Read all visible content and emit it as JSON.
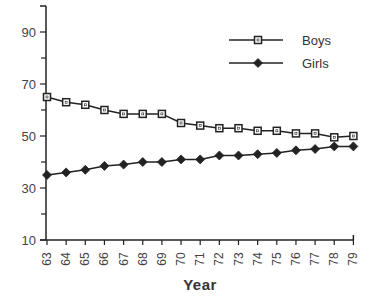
{
  "chart_data": {
    "type": "line",
    "title": "",
    "xlabel": "Year",
    "ylabel": "",
    "x": [
      "63",
      "64",
      "65",
      "66",
      "67",
      "68",
      "69",
      "70",
      "71",
      "72",
      "73",
      "74",
      "75",
      "76",
      "77",
      "78",
      "79"
    ],
    "series": [
      {
        "name": "Boys",
        "marker": "open-square",
        "values": [
          65,
          63,
          62,
          60,
          58.5,
          58.5,
          58.5,
          55,
          54,
          53,
          53,
          52,
          52,
          51,
          51,
          49.5,
          50
        ]
      },
      {
        "name": "Girls",
        "marker": "filled-diamond",
        "values": [
          35,
          36,
          37,
          38.5,
          39,
          40,
          40,
          41,
          41,
          42.5,
          42.5,
          43,
          43.5,
          44.5,
          45,
          46,
          46
        ]
      }
    ],
    "yticks": [
      10,
      30,
      50,
      70,
      90
    ],
    "yminor_ticks": [
      20,
      40,
      60,
      80
    ],
    "ylim": [
      10,
      100
    ],
    "grid": false,
    "legend_position": "upper right",
    "line_color": "#222222"
  }
}
